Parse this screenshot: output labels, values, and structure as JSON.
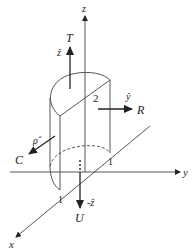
{
  "diagram": {
    "axes": {
      "x": "x",
      "y": "y",
      "z": "z"
    },
    "dimensions": {
      "height": "2",
      "radius_y": "1",
      "radius_x": "1"
    },
    "surfaces": [
      {
        "name": "T",
        "normal": "ẑ",
        "description": "top face"
      },
      {
        "name": "R",
        "normal": "ŷ",
        "description": "right flat face"
      },
      {
        "name": "C",
        "normal": "ρ̂",
        "description": "curved face"
      },
      {
        "name": "U",
        "normal": "-ẑ",
        "description": "bottom face"
      }
    ],
    "colors": {
      "stroke": "#333333",
      "background": "#ffffff"
    }
  }
}
